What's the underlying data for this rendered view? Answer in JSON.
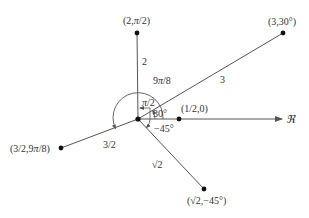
{
  "diagram": {
    "axis": {
      "label": "ℜ"
    },
    "points": [
      {
        "id": "p1",
        "label": "(2,",
        "label_pi": "π",
        "label_end": "/2)",
        "segment_label": "2"
      },
      {
        "id": "p2",
        "label": "(3,30°)",
        "segment_label": "3"
      },
      {
        "id": "p3",
        "label": "(1/2,0)"
      },
      {
        "id": "p4",
        "label": "(3/2,9",
        "label_pi": "π",
        "label_end": "/8)",
        "segment_label": "3/2"
      },
      {
        "id": "p5",
        "label": "(√2,−45°)",
        "segment_label": "√2"
      }
    ],
    "angles": {
      "a_pi2": {
        "pre": "",
        "pi": "π",
        "post": "/2"
      },
      "a_30": "30°",
      "a_9pi8": {
        "pre": "9",
        "pi": "π",
        "post": "/8"
      },
      "a_m45": "−45°"
    },
    "colors": {
      "line": "#555555",
      "point": "#111111",
      "text": "#333333"
    }
  }
}
